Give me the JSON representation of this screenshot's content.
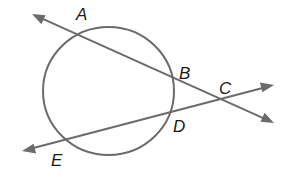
{
  "diagram": {
    "type": "geometry",
    "circle": {
      "cx": 108.5,
      "cy": 91,
      "rx": 65.5,
      "ry": 64,
      "color": "#6b6b6b"
    },
    "lines": [
      {
        "name": "secant-A-C",
        "from": [
          32,
          14
        ],
        "to": [
          274,
          123
        ],
        "arrows": "both",
        "through": [
          "A",
          "B",
          "C"
        ]
      },
      {
        "name": "secant-E-C",
        "from": [
          22,
          151
        ],
        "to": [
          274,
          85
        ],
        "arrows": "both",
        "through": [
          "E",
          "D",
          "C"
        ]
      }
    ],
    "points": [
      {
        "label": "A",
        "x": 78,
        "y": 35,
        "label_x": 76,
        "label_y": 20
      },
      {
        "label": "B",
        "x": 173,
        "y": 78,
        "label_x": 179,
        "label_y": 79
      },
      {
        "label": "C",
        "x": 220,
        "y": 99,
        "label_x": 219,
        "label_y": 94
      },
      {
        "label": "D",
        "x": 170,
        "y": 112,
        "label_x": 173,
        "label_y": 132
      },
      {
        "label": "E",
        "x": 65,
        "y": 138,
        "label_x": 51,
        "label_y": 166
      }
    ]
  },
  "labels": {
    "a": "A",
    "b": "B",
    "c": "C",
    "d": "D",
    "e": "E"
  }
}
